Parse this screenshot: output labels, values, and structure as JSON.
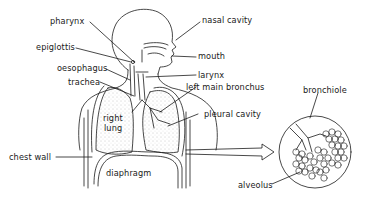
{
  "diagram": {
    "type": "anatomical",
    "labels": {
      "pharynx": "pharynx",
      "nasal_cavity": "nasal cavity",
      "epiglottis": "epiglottis",
      "mouth": "mouth",
      "oesophagus": "oesophagus",
      "larynx": "larynx",
      "trachea": "trachea",
      "left_main_bronchus": "left main bronchus",
      "pleural_cavity": "pleural cavity",
      "right_lung_line1": "right",
      "right_lung_line2": "lung",
      "chest_wall": "chest wall",
      "diaphragm": "diaphragm",
      "bronchiole": "bronchiole",
      "alveolus": "alveolus"
    },
    "colors": {
      "ink": "#1a1a1a",
      "background": "#ffffff",
      "lung_stipple": "#9a9a9a"
    }
  }
}
